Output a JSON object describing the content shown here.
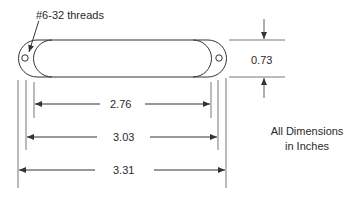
{
  "diagram": {
    "type": "dimension-drawing",
    "thread_callout": "#6-32 threads",
    "dimensions": {
      "height": "0.73",
      "inner_length": "2.76",
      "hole_spacing": "3.03",
      "overall_length": "3.31"
    },
    "units_note_line1": "All Dimensions",
    "units_note_line2": "in Inches",
    "colors": {
      "line": "#333333",
      "background": "#ffffff",
      "text": "#2a2a2a"
    }
  }
}
